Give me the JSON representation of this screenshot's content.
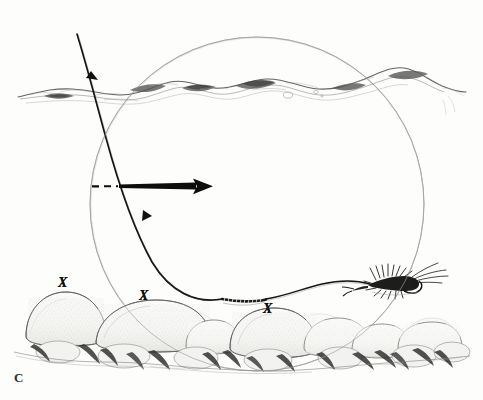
{
  "figure": {
    "panel_label": "C",
    "caption_label_position": "bottom-left",
    "medium": "pencil-and-ink line drawing",
    "background_color": "#fdfdfc",
    "ink_color": "#3a3a3a",
    "line_color_dark": "#111111",
    "pencil_color_light": "#9a9a9a",
    "stone_fill": "#f4f4f2",
    "stone_shadow": "#4a4a4a"
  },
  "annotations": {
    "x_marks": [
      {
        "label": "X",
        "name": "x-mark-left-stone"
      },
      {
        "label": "X",
        "name": "x-mark-center-stone"
      },
      {
        "label": "X",
        "name": "x-mark-right-stone"
      }
    ],
    "x_mark_count": 3
  },
  "elements": {
    "window_circle": {
      "name": "trout-window-circle",
      "center_x": 257,
      "center_y": 204,
      "radius": 167,
      "stroke": "#a7a7a7",
      "stroke_width": 0.9
    },
    "water_surface": {
      "name": "water-surface-line",
      "y_mean": 92,
      "stroke": "#6f6f6f",
      "description": "rippled broken water surface with wave crests and shading"
    },
    "fly_line": {
      "name": "fly-line-descending",
      "start_x": 77,
      "start_y": 34,
      "end_x": 234,
      "end_y": 300,
      "stroke": "#1a1a1a",
      "stroke_width": 1.6,
      "tick_arrows": 2
    },
    "current_arrow": {
      "name": "current-direction-arrow",
      "dash_start_x": 92,
      "solid_start_x": 120,
      "tip_x": 212,
      "y": 186,
      "stroke": "#0d0d0d",
      "direction": "right"
    },
    "leader_knot_section": {
      "name": "weighted-leader-segment",
      "start_x": 222,
      "end_x": 266,
      "y": 299,
      "description": "beaded / coiled weighted leader section"
    },
    "tippet": {
      "name": "tippet-to-fly",
      "start_x": 266,
      "start_y": 299,
      "end_x": 372,
      "end_y": 283
    },
    "fly": {
      "name": "nymph-fly",
      "x": 372,
      "y": 280,
      "width": 48,
      "height": 28,
      "description": "dark hackled wet fly / nymph drifting near the bottom"
    },
    "streambed": {
      "name": "streambed-cobble",
      "baseline_y": 340,
      "stone_count": 16,
      "description": "row of rounded cobblestones with stippled texture and dark undershadows"
    }
  }
}
